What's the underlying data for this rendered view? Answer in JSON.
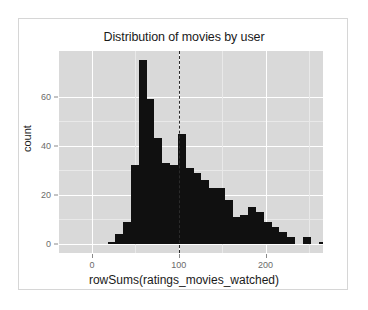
{
  "chart_data": {
    "type": "bar",
    "title": "Distribution of movies by user",
    "xlabel": "rowSums(ratings_movies_watched)",
    "ylabel": "count",
    "grid": true,
    "legend": "none",
    "xlim": [
      0,
      280
    ],
    "ylim": [
      0,
      78
    ],
    "x_ticks": [
      0,
      100,
      200
    ],
    "x_tick_labels": [
      "0",
      "100",
      "200"
    ],
    "y_ticks": [
      0,
      20,
      40,
      60
    ],
    "y_tick_labels": [
      "0",
      "20",
      "40",
      "60"
    ],
    "binwidth": 9,
    "bar_color": "#101010",
    "panel_color": "#d9d9d9",
    "grid_color": "#ffffff",
    "annotations": [
      {
        "name": "median-reference-line",
        "type": "vline",
        "x": 100,
        "style": "dashed",
        "color": "#2b2b2b"
      }
    ],
    "bins": [
      {
        "x0": 9,
        "x1": 18,
        "count": 0
      },
      {
        "x0": 18,
        "x1": 27,
        "count": 1
      },
      {
        "x0": 27,
        "x1": 36,
        "count": 4
      },
      {
        "x0": 36,
        "x1": 45,
        "count": 9
      },
      {
        "x0": 45,
        "x1": 54,
        "count": 32
      },
      {
        "x0": 54,
        "x1": 63,
        "count": 75
      },
      {
        "x0": 63,
        "x1": 72,
        "count": 59
      },
      {
        "x0": 72,
        "x1": 81,
        "count": 43
      },
      {
        "x0": 81,
        "x1": 90,
        "count": 33
      },
      {
        "x0": 90,
        "x1": 99,
        "count": 32
      },
      {
        "x0": 99,
        "x1": 108,
        "count": 45
      },
      {
        "x0": 108,
        "x1": 117,
        "count": 31
      },
      {
        "x0": 117,
        "x1": 126,
        "count": 29
      },
      {
        "x0": 126,
        "x1": 135,
        "count": 26
      },
      {
        "x0": 135,
        "x1": 144,
        "count": 23
      },
      {
        "x0": 144,
        "x1": 153,
        "count": 23
      },
      {
        "x0": 153,
        "x1": 162,
        "count": 18
      },
      {
        "x0": 162,
        "x1": 171,
        "count": 11
      },
      {
        "x0": 171,
        "x1": 180,
        "count": 12
      },
      {
        "x0": 180,
        "x1": 189,
        "count": 15
      },
      {
        "x0": 189,
        "x1": 198,
        "count": 13
      },
      {
        "x0": 198,
        "x1": 207,
        "count": 9
      },
      {
        "x0": 207,
        "x1": 216,
        "count": 7
      },
      {
        "x0": 216,
        "x1": 225,
        "count": 5
      },
      {
        "x0": 225,
        "x1": 234,
        "count": 3
      },
      {
        "x0": 234,
        "x1": 243,
        "count": 0
      },
      {
        "x0": 243,
        "x1": 252,
        "count": 3
      },
      {
        "x0": 252,
        "x1": 261,
        "count": 0
      },
      {
        "x0": 261,
        "x1": 270,
        "count": 1
      }
    ]
  }
}
